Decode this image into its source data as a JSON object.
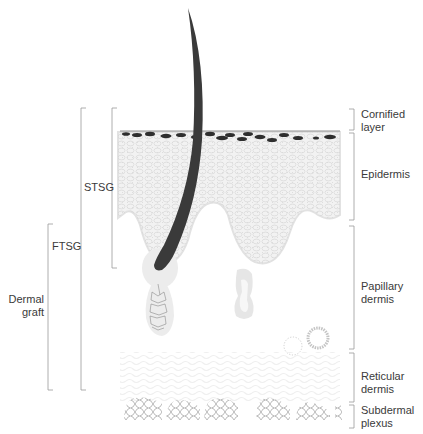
{
  "diagram": {
    "left_labels": {
      "stsg": "STSG",
      "ftsg": "FTSG",
      "dermal_graft_line1": "Dermal",
      "dermal_graft_line2": "graft"
    },
    "right_labels": {
      "cornified_line1": "Cornified",
      "cornified_line2": "layer",
      "epidermis": "Epidermis",
      "papillary_line1": "Papillary",
      "papillary_line2": "dermis",
      "reticular_line1": "Reticular",
      "reticular_line2": "dermis",
      "subdermal_line1": "Subdermal",
      "subdermal_line2": "plexus"
    },
    "colors": {
      "hair": "#3a3a3a",
      "bracket": "#9a9a9a",
      "tissue": "#ececec",
      "melanin": "#2e2e2e",
      "cell_outline": "#8a8a8a"
    }
  }
}
